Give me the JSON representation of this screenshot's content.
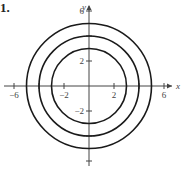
{
  "problem_number": "1.",
  "chart_data": {
    "type": "line",
    "title": "",
    "xlabel": "x",
    "ylabel": "y",
    "xlim": [
      -7,
      7
    ],
    "ylim": [
      -7,
      7
    ],
    "grid": false,
    "x_ticks": [
      -6,
      -2,
      2,
      6
    ],
    "x_tick_labels": [
      "-6",
      "-2",
      "2",
      "6"
    ],
    "y_ticks": [
      6,
      2,
      -2
    ],
    "y_tick_labels": [
      "6",
      "2",
      "-2"
    ],
    "minor_ticks_x": [
      -4,
      4
    ],
    "minor_ticks_y": [
      4,
      -4,
      -6
    ],
    "series": [
      {
        "name": "circle r=3",
        "center": [
          0,
          0
        ],
        "radius": 3
      },
      {
        "name": "circle r=4",
        "center": [
          0,
          0
        ],
        "radius": 4
      },
      {
        "name": "circle r=5",
        "center": [
          0,
          0
        ],
        "radius": 5
      }
    ],
    "style": {
      "line_color": "#1a1a1a",
      "axis_color": "#444444"
    }
  }
}
